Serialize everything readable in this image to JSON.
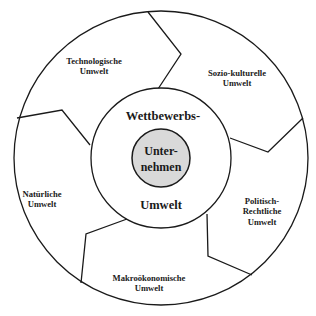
{
  "diagram": {
    "type": "concentric-environment-model",
    "colors": {
      "stroke": "#1a1a1a",
      "core_fill": "#d9d9d9",
      "background": "#ffffff"
    },
    "core": {
      "line1": "Unter-",
      "line2": "nehmen"
    },
    "middle_ring": {
      "top": "Wettbewerbs-",
      "bottom": "Umwelt"
    },
    "outer_segments": [
      {
        "id": "technologisch",
        "line1": "Technologische",
        "line2": "Umwelt"
      },
      {
        "id": "sozio-kulturell",
        "line1": "Sozio-kulturelle",
        "line2": "Umwelt"
      },
      {
        "id": "politisch-rechtlich",
        "line1": "Politisch-",
        "line2": "Rechtliche",
        "line3": "Umwelt"
      },
      {
        "id": "makrooekonomisch",
        "line1": "Makroökonomische",
        "line2": "Umwelt"
      },
      {
        "id": "natuerlich",
        "line1": "Natürliche",
        "line2": "Umwelt"
      }
    ]
  }
}
